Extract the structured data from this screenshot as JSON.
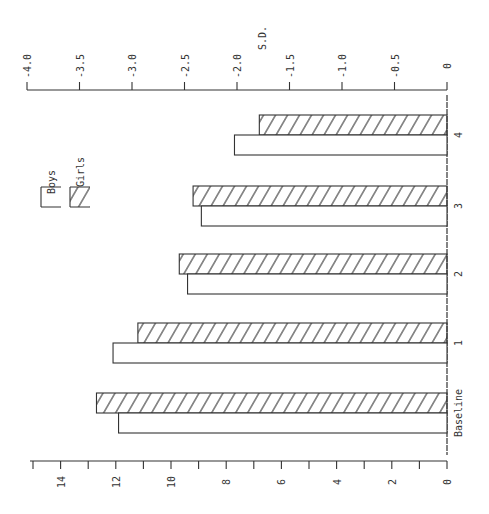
{
  "chart_data": {
    "type": "bar",
    "orientation": "horizontal (page rotated 90°)",
    "title": "",
    "categories": [
      "Baseline",
      "1",
      "2",
      "3",
      "4"
    ],
    "series": [
      {
        "name": "Boys",
        "pattern": "open",
        "values": [
          11.9,
          12.1,
          9.4,
          8.9,
          7.7
        ]
      },
      {
        "name": "Girls",
        "pattern": "hatched",
        "values": [
          12.7,
          11.2,
          9.7,
          9.2,
          6.8
        ]
      }
    ],
    "value_axis": {
      "label": "",
      "ticks": [
        "0",
        "2",
        "4",
        "6",
        "8",
        "10",
        "12",
        "14"
      ],
      "range": [
        0,
        15
      ],
      "minor_ticks_every": 1
    },
    "secondary_axis": {
      "label": "S.D.",
      "ticks": [
        "0",
        "-0.5",
        "-1.0",
        "-1.5",
        "-2.0",
        "-2.5",
        "-3.0",
        "-3.5",
        "-4.0"
      ],
      "range": [
        0,
        -4.0
      ]
    },
    "legend": {
      "position": "upper-left (rotated)",
      "entries": [
        {
          "label": "Boys",
          "pattern": "open"
        },
        {
          "label": "Girls",
          "pattern": "hatched"
        }
      ]
    },
    "grid": false
  }
}
